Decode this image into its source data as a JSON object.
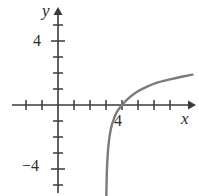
{
  "figure": {
    "width": 199,
    "height": 196,
    "background": "#ffffff"
  },
  "axes": {
    "x_axis_label": "x",
    "y_axis_label": "y",
    "axis_color": "#3a3a3a",
    "origin_px": {
      "x": 58,
      "y": 105
    },
    "unit_px": 16
  },
  "labels": {
    "y_four": "4",
    "y_minus_four": "−4",
    "x_four": "4"
  },
  "chart_data": {
    "type": "line",
    "title": "",
    "subtitle": "",
    "xlabel": "x",
    "ylabel": "y",
    "xlim": [
      -3,
      8.4
    ],
    "ylim": [
      -6,
      6
    ],
    "grid": false,
    "legend": null,
    "annotations": [],
    "curve_color": "#7a7a7a",
    "curve_width": 2.4,
    "vertical_asymptote": 3,
    "x_intercept": 4,
    "series": [
      {
        "name": "y = log(x - 3)",
        "x": [
          3.02,
          3.05,
          3.08,
          3.12,
          3.18,
          3.25,
          3.35,
          3.5,
          3.7,
          4.0,
          4.4,
          4.9,
          5.5,
          6.2,
          7.0,
          7.8,
          8.4
        ],
        "y": [
          -5.7,
          -4.3,
          -3.6,
          -2.9,
          -2.3,
          -1.8,
          -1.3,
          -0.85,
          -0.4,
          0.0,
          0.42,
          0.8,
          1.12,
          1.4,
          1.6,
          1.78,
          1.9
        ]
      }
    ],
    "x_ticks": [
      -2,
      -1,
      0,
      1,
      2,
      3,
      4,
      5,
      6,
      7,
      8
    ],
    "y_ticks": [
      -5,
      -4,
      -3,
      -2,
      -1,
      0,
      1,
      2,
      3,
      4,
      5
    ],
    "labeled_x_ticks": [
      {
        "value": 4,
        "text": "4"
      }
    ],
    "labeled_y_ticks": [
      {
        "value": 4,
        "text": "4"
      },
      {
        "value": -4,
        "text": "−4"
      }
    ]
  }
}
